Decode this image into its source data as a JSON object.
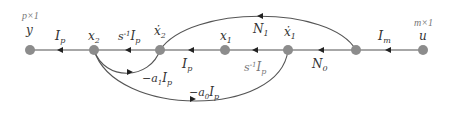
{
  "diagram": {
    "type": "signal-flow-graph",
    "nodes": [
      {
        "id": "y",
        "label": "y",
        "dim": "p×1",
        "x": 30
      },
      {
        "id": "x2",
        "label": "x",
        "sub": "2",
        "x": 94
      },
      {
        "id": "x2dot",
        "label": "ẋ",
        "sub": "2",
        "x": 160
      },
      {
        "id": "x1",
        "label": "x",
        "sub": "1",
        "x": 225
      },
      {
        "id": "x1dot",
        "label": "ẋ",
        "sub": "1",
        "x": 288
      },
      {
        "id": "n6",
        "label": "",
        "x": 356
      },
      {
        "id": "u",
        "label": "u",
        "dim": "m×1",
        "x": 423
      }
    ],
    "edges": [
      {
        "from": "u",
        "to": "n6",
        "label": "I",
        "sub": "m"
      },
      {
        "from": "n6",
        "to": "x1dot",
        "label": "N",
        "sub": "0"
      },
      {
        "from": "x1dot",
        "to": "x1",
        "label": "s⁻¹I",
        "sub": "p"
      },
      {
        "from": "x1",
        "to": "x2dot",
        "label": "I",
        "sub": "p"
      },
      {
        "from": "x2dot",
        "to": "x2",
        "label": "s⁻¹I",
        "sub": "p"
      },
      {
        "from": "x2",
        "to": "y",
        "label": "I",
        "sub": "p"
      },
      {
        "from": "n6",
        "to": "x2dot",
        "label": "N",
        "sub": "1"
      },
      {
        "from": "x2",
        "to": "x2dot",
        "label": "−a",
        "asub": "1",
        "tail": "I",
        "sub": "p"
      },
      {
        "from": "x2",
        "to": "x1dot",
        "label": "−a",
        "asub": "0",
        "tail": "I",
        "sub": "p"
      }
    ]
  },
  "labels": {
    "y_dim": "p×1",
    "y": "y",
    "u_dim": "m×1",
    "u": "u",
    "x2": "x",
    "x2_sub": "2",
    "x2dot": "ẋ",
    "x2dot_sub": "2",
    "x1": "x",
    "x1_sub": "1",
    "x1dot": "ẋ",
    "x1dot_sub": "1",
    "e_y_I": "I",
    "e_y_sub": "p",
    "e_s1": "s",
    "e_s1_sup": "-1",
    "e_s1_I": "I",
    "e_s1_sub": "p",
    "e_mid_I": "I",
    "e_mid_sub": "p",
    "e_s2": "s",
    "e_s2_sup": "-1",
    "e_s2_I": "I",
    "e_s2_sub": "p",
    "e_N0": "N",
    "e_N0_sub": "0",
    "e_Im": "I",
    "e_Im_sub": "m",
    "e_N1": "N",
    "e_N1_sub": "1",
    "e_a1_pre": "−a",
    "e_a1_sub": "1",
    "e_a1_I": "I",
    "e_a1_Isub": "p",
    "e_a0_pre": "−a",
    "e_a0_sub": "0",
    "e_a0_I": "I",
    "e_a0_Isub": "p"
  },
  "colors": {
    "node": "#8c8c8c",
    "edge": "#555555",
    "text": "#333333"
  }
}
